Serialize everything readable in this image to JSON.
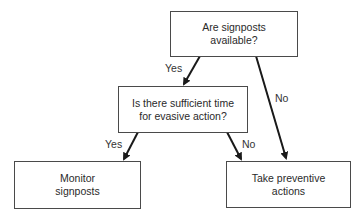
{
  "diagram": {
    "type": "decision-flowchart",
    "nodes": [
      {
        "id": "q1",
        "line1": "Are signposts",
        "line2": "available?"
      },
      {
        "id": "q2",
        "line1": "Is there sufficient time",
        "line2": "for evasive action?"
      },
      {
        "id": "a1",
        "line1": "Monitor",
        "line2": "signposts"
      },
      {
        "id": "a2",
        "line1": "Take preventive",
        "line2": "actions"
      }
    ],
    "edges": [
      {
        "from": "q1",
        "to": "q2",
        "label": "Yes"
      },
      {
        "from": "q1",
        "to": "a2",
        "label": "No"
      },
      {
        "from": "q2",
        "to": "a1",
        "label": "Yes"
      },
      {
        "from": "q2",
        "to": "a2",
        "label": "No"
      }
    ]
  }
}
